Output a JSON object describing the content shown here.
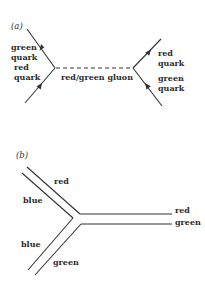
{
  "diagram": {
    "panel_a": {
      "label": "(a)",
      "left_incoming_top": {
        "line1": "green",
        "line2": "quark"
      },
      "left_incoming_bottom": {
        "line1": "red",
        "line2": "quark"
      },
      "propagator": "red/green gluon",
      "right_outgoing_top": {
        "line1": "red",
        "line2": "quark"
      },
      "right_outgoing_bottom": {
        "line1": "green",
        "line2": "quark"
      }
    },
    "panel_b": {
      "label": "(b)",
      "upper_branch_outer": "red",
      "upper_branch_inner": "blue",
      "lower_branch_inner": "blue",
      "lower_branch_outer": "green",
      "right_top": "red",
      "right_bottom": "green"
    },
    "colors": {
      "ink": "#333333",
      "background": "#ffffff"
    }
  }
}
